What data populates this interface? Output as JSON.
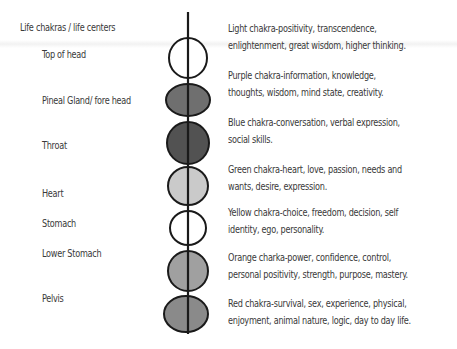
{
  "title": "Life chakras / life centers",
  "chakras": [
    {
      "location": "Top of head",
      "fill": "#ffffff",
      "description": [
        "Light chakra-positivity, transcendence,",
        "enlightenment, great wisdom, higher thinking."
      ]
    },
    {
      "location": "Pineal Gland/ fore head",
      "fill": "#6f6f6f",
      "description": [
        "Purple chakra-information, knowledge,",
        "thoughts, wisdom, mind state, creativity."
      ]
    },
    {
      "location": "Throat",
      "fill": "#525252",
      "description": [
        "Blue chakra-conversation, verbal expression,",
        "social skills."
      ]
    },
    {
      "location": "Heart",
      "fill": "#cacaca",
      "description": [
        "Green chakra-heart, love, passion, needs and",
        "wants, desire, expression."
      ]
    },
    {
      "location": "Stomach",
      "fill": "#ffffff",
      "description": [
        "Yellow chakra-choice, freedom, decision, self",
        "identity, ego, personality."
      ]
    },
    {
      "location": "Lower Stomach",
      "fill": "#a0a0a0",
      "description": [
        "Orange charka-power, confidence, control,",
        "personal positivity, strength, purpose, mastery."
      ]
    },
    {
      "location": "Pelvis",
      "fill": "#8a8a8a",
      "description": [
        "Red chakra-survival, sex, experience, physical,",
        "enjoyment, animal nature, logic, day to day life."
      ]
    }
  ]
}
